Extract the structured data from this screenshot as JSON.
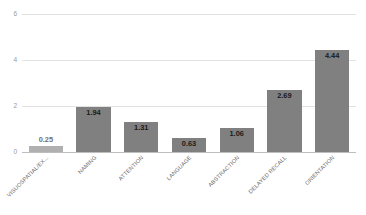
{
  "chart_data": {
    "type": "bar",
    "title": "",
    "subtitle": "",
    "xlabel": "",
    "ylabel": "",
    "categories": [
      "VISUOSPATIAL/EX...",
      "NAMING",
      "ATTENTION",
      "LANGUAGE",
      "ABSTRACTION",
      "DELAYED RECALL",
      "ORIENTATION"
    ],
    "values": [
      0.25,
      1.94,
      1.31,
      0.63,
      1.06,
      2.69,
      4.44
    ],
    "value_labels": [
      "0.25",
      "1.94",
      "1.31",
      "0.63",
      "1.06",
      "2.69",
      "4.44"
    ],
    "ylim": [
      0,
      6
    ],
    "yticks": [
      0,
      2,
      4,
      6
    ],
    "ytick_labels": [
      "0",
      "2",
      "4",
      "6"
    ],
    "grid": true,
    "legend": false,
    "legend_position": "none",
    "bar_color": "#808080",
    "bar_color_first": "#b0b0b0",
    "gridline_color": "#e2e2e2",
    "axis_color": "#bdbdbd",
    "label_color": "#6b6b6b",
    "value_label_color": "#1a1a1a",
    "background": "#ffffff"
  }
}
